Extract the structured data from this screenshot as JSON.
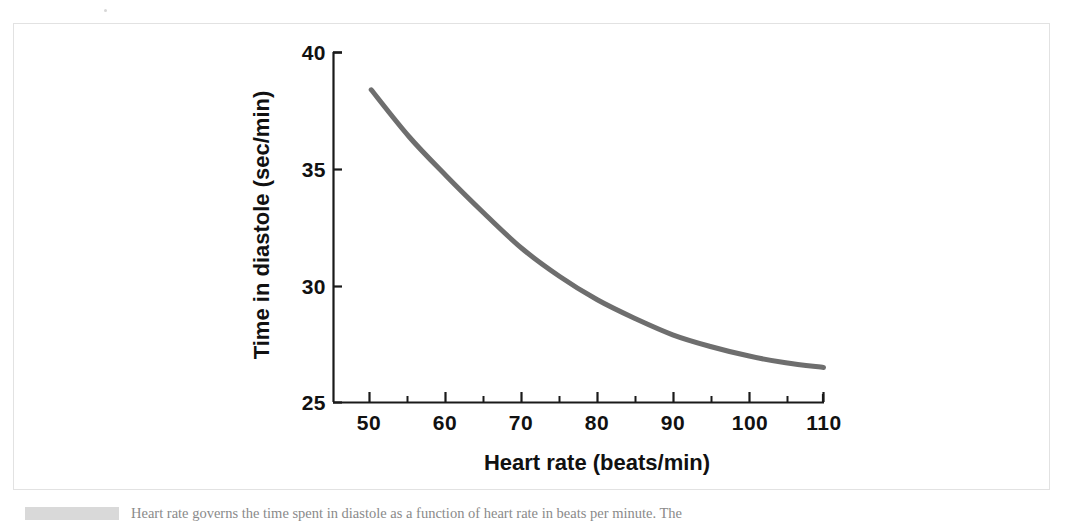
{
  "figure": {
    "caption_tag": "",
    "caption_text": "Heart rate governs the time spent in diastole as a function of heart rate in beats per minute. The"
  },
  "chart_data": {
    "type": "line",
    "title": "",
    "xlabel": "Heart rate (beats/min)",
    "ylabel": "Time in diastole (sec/min)",
    "xlim": [
      45,
      110
    ],
    "ylim": [
      25,
      40
    ],
    "xticks": [
      50,
      60,
      70,
      80,
      90,
      100,
      110
    ],
    "xtick_labels": [
      "50",
      "60",
      "70",
      "80",
      "90",
      "100",
      "110"
    ],
    "x_minor_tick_step": 5,
    "yticks": [
      25,
      30,
      35,
      40
    ],
    "ytick_labels": [
      "25",
      "30",
      "35",
      "40"
    ],
    "grid": false,
    "legend": null,
    "series": [
      {
        "name": "Time in diastole",
        "color": "#6e6e6e",
        "line_width": 5,
        "x": [
          50,
          55,
          60,
          65,
          70,
          75,
          80,
          85,
          90,
          95,
          100,
          105,
          110
        ],
        "y": [
          38.4,
          36.4,
          34.7,
          33.1,
          31.6,
          30.4,
          29.4,
          28.6,
          27.9,
          27.4,
          27.0,
          26.7,
          26.5
        ]
      }
    ]
  }
}
